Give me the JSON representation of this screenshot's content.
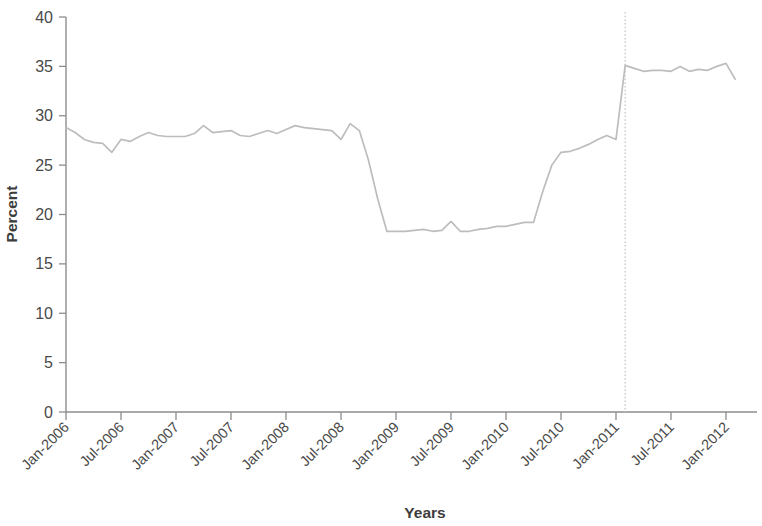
{
  "chart_data": {
    "type": "line",
    "title": "",
    "subtitle": "",
    "xlabel": "Years",
    "ylabel": "Percent",
    "ylim": [
      0,
      40
    ],
    "ytick_values": [
      0,
      5,
      10,
      15,
      20,
      25,
      30,
      35,
      40
    ],
    "ytick_labels": [
      "0",
      "5",
      "10",
      "15",
      "20",
      "25",
      "30",
      "35",
      "40"
    ],
    "xtick_labels": [
      "Jan-2006",
      "Jul-2006",
      "Jan-2007",
      "Jul-2007",
      "Jan-2008",
      "Jul-2008",
      "Jan-2009",
      "Jul-2009",
      "Jan-2010",
      "Jul-2010",
      "Jan-2011",
      "Jul-2011",
      "Jan-2012"
    ],
    "grid": false,
    "legend": false,
    "legend_position": "none",
    "line_color": "#bdbdbd",
    "axis_color": "#8d8d8d",
    "text_color": "#3c3c3c",
    "annotations": [
      {
        "name": "policy-change-reference-line",
        "type": "vertical-dotted-line",
        "x": "Feb-2011",
        "color": "#c9c9c9"
      }
    ],
    "x": [
      "Jan-2006",
      "Feb-2006",
      "Mar-2006",
      "Apr-2006",
      "May-2006",
      "Jun-2006",
      "Jul-2006",
      "Aug-2006",
      "Sep-2006",
      "Oct-2006",
      "Nov-2006",
      "Dec-2006",
      "Jan-2007",
      "Feb-2007",
      "Mar-2007",
      "Apr-2007",
      "May-2007",
      "Jun-2007",
      "Jul-2007",
      "Aug-2007",
      "Sep-2007",
      "Oct-2007",
      "Nov-2007",
      "Dec-2007",
      "Jan-2008",
      "Feb-2008",
      "Mar-2008",
      "Apr-2008",
      "May-2008",
      "Jun-2008",
      "Jul-2008",
      "Aug-2008",
      "Sep-2008",
      "Oct-2008",
      "Nov-2008",
      "Dec-2008",
      "Jan-2009",
      "Feb-2009",
      "Mar-2009",
      "Apr-2009",
      "May-2009",
      "Jun-2009",
      "Jul-2009",
      "Aug-2009",
      "Sep-2009",
      "Oct-2009",
      "Nov-2009",
      "Dec-2009",
      "Jan-2010",
      "Feb-2010",
      "Mar-2010",
      "Apr-2010",
      "May-2010",
      "Jun-2010",
      "Jul-2010",
      "Aug-2010",
      "Sep-2010",
      "Oct-2010",
      "Nov-2010",
      "Dec-2010",
      "Jan-2011",
      "Feb-2011",
      "Mar-2011",
      "Apr-2011",
      "May-2011",
      "Jun-2011",
      "Jul-2011",
      "Aug-2011",
      "Sep-2011",
      "Oct-2011",
      "Nov-2011",
      "Dec-2011",
      "Jan-2012",
      "Feb-2012"
    ],
    "values": [
      28.8,
      28.3,
      27.6,
      27.3,
      27.2,
      26.3,
      27.6,
      27.4,
      27.9,
      28.3,
      28.0,
      27.9,
      27.9,
      27.9,
      28.2,
      29.0,
      28.3,
      28.4,
      28.5,
      28.0,
      27.9,
      28.2,
      28.5,
      28.2,
      28.6,
      29.0,
      28.8,
      28.7,
      28.6,
      28.5,
      27.6,
      29.2,
      28.5,
      25.5,
      21.6,
      18.3,
      18.3,
      18.3,
      18.4,
      18.5,
      18.3,
      18.4,
      19.3,
      18.3,
      18.3,
      18.5,
      18.6,
      18.8,
      18.8,
      19.0,
      19.2,
      19.2,
      22.3,
      25.0,
      26.3,
      26.4,
      26.7,
      27.1,
      27.6,
      28.0,
      27.6,
      35.1,
      34.8,
      34.5,
      34.6,
      34.6,
      34.5,
      35.0,
      34.5,
      34.7,
      34.6,
      35.0,
      35.3,
      33.7
    ]
  }
}
